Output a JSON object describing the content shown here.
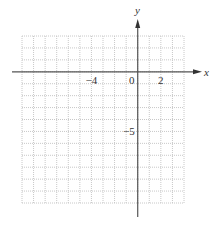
{
  "chart_data": {
    "type": "coordinate-grid",
    "title": "",
    "xlabel": "x",
    "ylabel": "y",
    "xlim": [
      -10,
      4
    ],
    "ylim": [
      -11,
      3
    ],
    "grid": true,
    "grid_style": "dotted",
    "grid_step": 1,
    "x_tick_labels": [
      {
        "value": -4,
        "label": "−4"
      },
      {
        "value": 0,
        "label": "0"
      },
      {
        "value": 2,
        "label": "2"
      }
    ],
    "y_tick_labels": [
      {
        "value": -5,
        "label": "−5"
      }
    ],
    "series": []
  },
  "colors": {
    "grid": "#c8c8c8",
    "axis": "#555555",
    "text": "#333333"
  }
}
